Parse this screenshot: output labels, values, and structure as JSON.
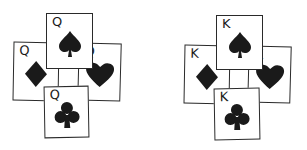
{
  "groups": [
    {
      "name": "queens",
      "cards": [
        {
          "rank": "Q",
          "suit": "spade"
        },
        {
          "rank": "Q",
          "suit": "diamond"
        },
        {
          "rank": "Q",
          "suit": "heart"
        },
        {
          "rank": "Q",
          "suit": "club"
        }
      ]
    },
    {
      "name": "kings",
      "cards": [
        {
          "rank": "K",
          "suit": "spade"
        },
        {
          "rank": "K",
          "suit": "diamond"
        },
        {
          "rank": "K",
          "suit": "heart"
        },
        {
          "rank": "K",
          "suit": "club"
        }
      ]
    }
  ],
  "colors": {
    "ink": "#1a1a1a",
    "background": "#ffffff"
  }
}
